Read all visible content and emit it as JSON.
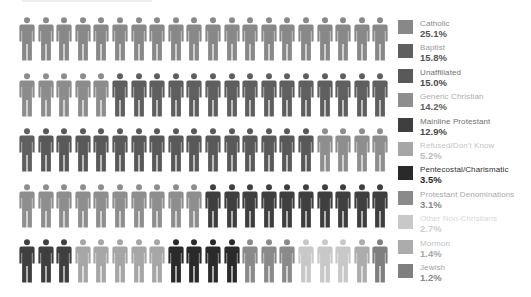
{
  "chart_data": {
    "type": "pictogram",
    "title": "",
    "unit": "percent of population (1 figure = 1%)",
    "grid": {
      "rows": 5,
      "cols": 20
    },
    "legend_position": "right",
    "categories": [
      "Catholic",
      "Baptist",
      "Unaffiliated",
      "Generic Christian",
      "Mainline Protestant",
      "Refused/Don't Know",
      "Pentecostal/Charismatic",
      "Protestant Denominations",
      "Other Non-Christians",
      "Mormon",
      "Jewish"
    ],
    "values": [
      25.1,
      15.8,
      15.0,
      14.2,
      12.9,
      5.2,
      3.5,
      3.1,
      2.7,
      1.4,
      1.2
    ],
    "figure_counts": [
      25,
      16,
      15,
      14,
      13,
      5,
      4,
      3,
      3,
      1,
      1
    ],
    "colors": [
      "#888888",
      "#5f5f5f",
      "#595959",
      "#8e8e8e",
      "#3f3f3f",
      "#a6a6a6",
      "#2a2a2a",
      "#8a8a8a",
      "#c8c8c8",
      "#acacac",
      "#7f7f7f"
    ]
  },
  "legend": {
    "items": [
      {
        "label": "Catholic",
        "value": "25.1%",
        "color": "#888888",
        "label_color": "#8a8a8a",
        "value_color": "#555555"
      },
      {
        "label": "Baptist",
        "value": "15.8%",
        "color": "#5f5f5f",
        "label_color": "#9a9a9a",
        "value_color": "#555555"
      },
      {
        "label": "Unaffiliated",
        "value": "15.0%",
        "color": "#595959",
        "label_color": "#707070",
        "value_color": "#4a4a4a"
      },
      {
        "label": "Generic Christian",
        "value": "14.2%",
        "color": "#8e8e8e",
        "label_color": "#aaaaaa",
        "value_color": "#606060"
      },
      {
        "label": "Mainline Protestant",
        "value": "12.9%",
        "color": "#3f3f3f",
        "label_color": "#707070",
        "value_color": "#4a4a4a"
      },
      {
        "label": "Refused/Don't Know",
        "value": "5.2%",
        "color": "#a6a6a6",
        "label_color": "#c4c4c4",
        "value_color": "#bdbdbd"
      },
      {
        "label": "Pentecostal/Charismatic",
        "value": "3.5%",
        "color": "#2a2a2a",
        "label_color": "#2f2f2f",
        "value_color": "#2a2a2a"
      },
      {
        "label": "Protestant Denominations",
        "value": "3.1%",
        "color": "#8a8a8a",
        "label_color": "#a8a8a8",
        "value_color": "#888888"
      },
      {
        "label": "Other Non-Christians",
        "value": "2.7%",
        "color": "#c8c8c8",
        "label_color": "#d8d8d8",
        "value_color": "#cfcfcf"
      },
      {
        "label": "Mormon",
        "value": "1.4%",
        "color": "#acacac",
        "label_color": "#c0c0c0",
        "value_color": "#a8a8a8"
      },
      {
        "label": "Jewish",
        "value": "1.2%",
        "color": "#7f7f7f",
        "label_color": "#a0a0a0",
        "value_color": "#8a8a8a"
      }
    ]
  },
  "figure_colors": [
    "#888888",
    "#888888",
    "#888888",
    "#888888",
    "#888888",
    "#888888",
    "#888888",
    "#888888",
    "#888888",
    "#888888",
    "#888888",
    "#888888",
    "#888888",
    "#888888",
    "#888888",
    "#888888",
    "#888888",
    "#888888",
    "#888888",
    "#888888",
    "#8c8c8c",
    "#8c8c8c",
    "#8c8c8c",
    "#8c8c8c",
    "#8c8c8c",
    "#5f5f5f",
    "#5f5f5f",
    "#5f5f5f",
    "#5f5f5f",
    "#5f5f5f",
    "#5f5f5f",
    "#5f5f5f",
    "#5f5f5f",
    "#5f5f5f",
    "#5f5f5f",
    "#5f5f5f",
    "#5f5f5f",
    "#5f5f5f",
    "#5f5f5f",
    "#5f5f5f",
    "#5f5f5f",
    "#595959",
    "#595959",
    "#595959",
    "#595959",
    "#595959",
    "#595959",
    "#595959",
    "#595959",
    "#595959",
    "#595959",
    "#595959",
    "#595959",
    "#595959",
    "#595959",
    "#595959",
    "#8e8e8e",
    "#8e8e8e",
    "#8e8e8e",
    "#8e8e8e",
    "#8e8e8e",
    "#8e8e8e",
    "#8e8e8e",
    "#8e8e8e",
    "#8e8e8e",
    "#8e8e8e",
    "#8e8e8e",
    "#8e8e8e",
    "#8e8e8e",
    "#8e8e8e",
    "#3f3f3f",
    "#3f3f3f",
    "#3f3f3f",
    "#3f3f3f",
    "#3f3f3f",
    "#3f3f3f",
    "#3f3f3f",
    "#3f3f3f",
    "#3f3f3f",
    "#3f3f3f",
    "#3f3f3f",
    "#3f3f3f",
    "#3f3f3f",
    "#a6a6a6",
    "#a6a6a6",
    "#a6a6a6",
    "#a6a6a6",
    "#a6a6a6",
    "#2a2a2a",
    "#2a2a2a",
    "#2a2a2a",
    "#2a2a2a",
    "#8a8a8a",
    "#8a8a8a",
    "#8a8a8a",
    "#c8c8c8",
    "#c8c8c8",
    "#c8c8c8",
    "#acacac",
    "#7f7f7f"
  ]
}
